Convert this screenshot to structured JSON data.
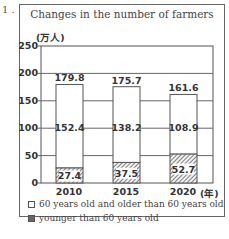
{
  "question_number": "1 .",
  "chart_data": {
    "type": "bar",
    "stacked": true,
    "title": "Changes in the number of farmers",
    "ylabel": "(万人)",
    "xlabel": "(年)",
    "categories": [
      "2010",
      "2015",
      "2020"
    ],
    "series": [
      {
        "name": "younger than 60 years old",
        "values": [
          27.4,
          37.5,
          52.7
        ],
        "fill": "hatched"
      },
      {
        "name": "60 years old and older than 60 years old",
        "values": [
          152.4,
          138.2,
          108.9
        ],
        "fill": "white"
      }
    ],
    "totals": [
      179.8,
      175.7,
      161.6
    ],
    "ylim": [
      0,
      250
    ],
    "yticks": [
      "0",
      "50",
      "100",
      "150",
      "200",
      "250"
    ],
    "grid": true,
    "legend_position": "bottom"
  },
  "legend": [
    {
      "label": "60 years old and older than 60 years old",
      "swatch": "white"
    },
    {
      "label": "younger than 60 years old",
      "swatch": "dark"
    }
  ]
}
